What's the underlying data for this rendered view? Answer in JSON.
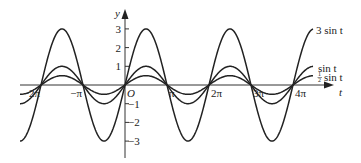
{
  "chart_data": {
    "type": "line",
    "title": "",
    "xlabel": "t",
    "ylabel": "y",
    "origin_label": "O",
    "x_ticks": [
      {
        "value": -6.283,
        "label": "−2π"
      },
      {
        "value": -3.1416,
        "label": "−π"
      },
      {
        "value": 3.1416,
        "label": "π"
      },
      {
        "value": 6.283,
        "label": "2π"
      },
      {
        "value": 9.4248,
        "label": "3π"
      },
      {
        "value": 12.566,
        "label": "4π"
      }
    ],
    "y_ticks": [
      {
        "value": 3,
        "label": "3"
      },
      {
        "value": 2,
        "label": "2"
      },
      {
        "value": 1,
        "label": "1"
      },
      {
        "value": -1,
        "label": "−1"
      },
      {
        "value": -2,
        "label": "−2"
      },
      {
        "value": -3,
        "label": "−3"
      }
    ],
    "xlim": [
      -8.4,
      14.0
    ],
    "ylim": [
      -3.8,
      3.9
    ],
    "grid": false,
    "series": [
      {
        "name": "3 sin t",
        "amplitude": 3,
        "function": "3*sin(t)",
        "label_main": "3 sin t"
      },
      {
        "name": "sin t",
        "amplitude": 1,
        "function": "sin(t)",
        "label_main": "sin t"
      },
      {
        "name": "1/2 sin t",
        "amplitude": 0.5,
        "function": "0.5*sin(t)",
        "label_frac_num": "1",
        "label_frac_den": "2",
        "label_main": "sin t"
      }
    ]
  }
}
